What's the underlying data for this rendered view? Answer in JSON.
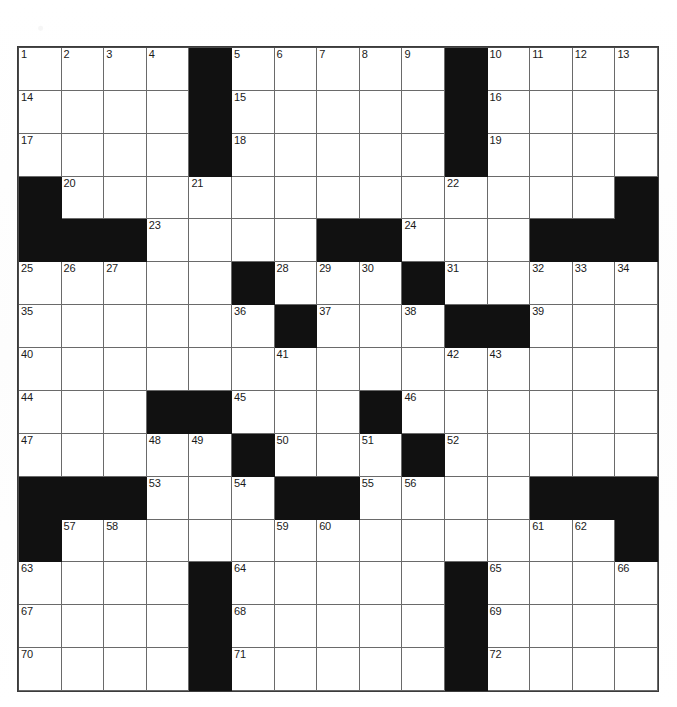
{
  "page": {
    "background_color": "#ffffff",
    "ink_color": "#111111",
    "grid_line_color": "#6a6a6a"
  },
  "grid": {
    "name": "crossword-grid",
    "rows": 15,
    "columns": 15,
    "block_color": "#111111",
    "cell_color": "#ffffff",
    "cells": [
      [
        {
          "type": "open",
          "number": "1"
        },
        {
          "type": "open",
          "number": "2"
        },
        {
          "type": "open",
          "number": "3"
        },
        {
          "type": "open",
          "number": "4"
        },
        {
          "type": "block",
          "number": ""
        },
        {
          "type": "open",
          "number": "5"
        },
        {
          "type": "open",
          "number": "6"
        },
        {
          "type": "open",
          "number": "7"
        },
        {
          "type": "open",
          "number": "8"
        },
        {
          "type": "open",
          "number": "9"
        },
        {
          "type": "block",
          "number": ""
        },
        {
          "type": "open",
          "number": "10"
        },
        {
          "type": "open",
          "number": "11"
        },
        {
          "type": "open",
          "number": "12"
        },
        {
          "type": "open",
          "number": "13"
        }
      ],
      [
        {
          "type": "open",
          "number": "14"
        },
        {
          "type": "open",
          "number": ""
        },
        {
          "type": "open",
          "number": ""
        },
        {
          "type": "open",
          "number": ""
        },
        {
          "type": "block",
          "number": ""
        },
        {
          "type": "open",
          "number": "15"
        },
        {
          "type": "open",
          "number": ""
        },
        {
          "type": "open",
          "number": ""
        },
        {
          "type": "open",
          "number": ""
        },
        {
          "type": "open",
          "number": ""
        },
        {
          "type": "block",
          "number": ""
        },
        {
          "type": "open",
          "number": "16"
        },
        {
          "type": "open",
          "number": ""
        },
        {
          "type": "open",
          "number": ""
        },
        {
          "type": "open",
          "number": ""
        }
      ],
      [
        {
          "type": "open",
          "number": "17"
        },
        {
          "type": "open",
          "number": ""
        },
        {
          "type": "open",
          "number": ""
        },
        {
          "type": "open",
          "number": ""
        },
        {
          "type": "block",
          "number": ""
        },
        {
          "type": "open",
          "number": "18"
        },
        {
          "type": "open",
          "number": ""
        },
        {
          "type": "open",
          "number": ""
        },
        {
          "type": "open",
          "number": ""
        },
        {
          "type": "open",
          "number": ""
        },
        {
          "type": "block",
          "number": ""
        },
        {
          "type": "open",
          "number": "19"
        },
        {
          "type": "open",
          "number": ""
        },
        {
          "type": "open",
          "number": ""
        },
        {
          "type": "open",
          "number": ""
        }
      ],
      [
        {
          "type": "block",
          "number": ""
        },
        {
          "type": "open",
          "number": "20"
        },
        {
          "type": "open",
          "number": ""
        },
        {
          "type": "open",
          "number": ""
        },
        {
          "type": "open",
          "number": "21"
        },
        {
          "type": "open",
          "number": ""
        },
        {
          "type": "open",
          "number": ""
        },
        {
          "type": "open",
          "number": ""
        },
        {
          "type": "open",
          "number": ""
        },
        {
          "type": "open",
          "number": ""
        },
        {
          "type": "open",
          "number": "22"
        },
        {
          "type": "open",
          "number": ""
        },
        {
          "type": "open",
          "number": ""
        },
        {
          "type": "open",
          "number": ""
        },
        {
          "type": "block",
          "number": ""
        }
      ],
      [
        {
          "type": "block",
          "number": ""
        },
        {
          "type": "block",
          "number": ""
        },
        {
          "type": "block",
          "number": ""
        },
        {
          "type": "open",
          "number": "23"
        },
        {
          "type": "open",
          "number": ""
        },
        {
          "type": "open",
          "number": ""
        },
        {
          "type": "open",
          "number": ""
        },
        {
          "type": "block",
          "number": ""
        },
        {
          "type": "block",
          "number": ""
        },
        {
          "type": "open",
          "number": "24"
        },
        {
          "type": "open",
          "number": ""
        },
        {
          "type": "open",
          "number": ""
        },
        {
          "type": "block",
          "number": ""
        },
        {
          "type": "block",
          "number": ""
        },
        {
          "type": "block",
          "number": ""
        }
      ],
      [
        {
          "type": "open",
          "number": "25"
        },
        {
          "type": "open",
          "number": "26"
        },
        {
          "type": "open",
          "number": "27"
        },
        {
          "type": "open",
          "number": ""
        },
        {
          "type": "open",
          "number": ""
        },
        {
          "type": "block",
          "number": ""
        },
        {
          "type": "open",
          "number": "28"
        },
        {
          "type": "open",
          "number": "29"
        },
        {
          "type": "open",
          "number": "30"
        },
        {
          "type": "block",
          "number": ""
        },
        {
          "type": "open",
          "number": "31"
        },
        {
          "type": "open",
          "number": ""
        },
        {
          "type": "open",
          "number": "32"
        },
        {
          "type": "open",
          "number": "33"
        },
        {
          "type": "open",
          "number": "34"
        }
      ],
      [
        {
          "type": "open",
          "number": "35"
        },
        {
          "type": "open",
          "number": ""
        },
        {
          "type": "open",
          "number": ""
        },
        {
          "type": "open",
          "number": ""
        },
        {
          "type": "open",
          "number": ""
        },
        {
          "type": "open",
          "number": "36"
        },
        {
          "type": "block",
          "number": ""
        },
        {
          "type": "open",
          "number": "37"
        },
        {
          "type": "open",
          "number": ""
        },
        {
          "type": "open",
          "number": "38"
        },
        {
          "type": "block",
          "number": ""
        },
        {
          "type": "block",
          "number": ""
        },
        {
          "type": "open",
          "number": "39"
        },
        {
          "type": "open",
          "number": ""
        },
        {
          "type": "open",
          "number": ""
        }
      ],
      [
        {
          "type": "open",
          "number": "40"
        },
        {
          "type": "open",
          "number": ""
        },
        {
          "type": "open",
          "number": ""
        },
        {
          "type": "open",
          "number": ""
        },
        {
          "type": "open",
          "number": ""
        },
        {
          "type": "open",
          "number": ""
        },
        {
          "type": "open",
          "number": "41"
        },
        {
          "type": "open",
          "number": ""
        },
        {
          "type": "open",
          "number": ""
        },
        {
          "type": "open",
          "number": ""
        },
        {
          "type": "open",
          "number": "42"
        },
        {
          "type": "open",
          "number": "43"
        },
        {
          "type": "open",
          "number": ""
        },
        {
          "type": "open",
          "number": ""
        },
        {
          "type": "open",
          "number": ""
        }
      ],
      [
        {
          "type": "open",
          "number": "44"
        },
        {
          "type": "open",
          "number": ""
        },
        {
          "type": "open",
          "number": ""
        },
        {
          "type": "block",
          "number": ""
        },
        {
          "type": "block",
          "number": ""
        },
        {
          "type": "open",
          "number": "45"
        },
        {
          "type": "open",
          "number": ""
        },
        {
          "type": "open",
          "number": ""
        },
        {
          "type": "block",
          "number": ""
        },
        {
          "type": "open",
          "number": "46"
        },
        {
          "type": "open",
          "number": ""
        },
        {
          "type": "open",
          "number": ""
        },
        {
          "type": "open",
          "number": ""
        },
        {
          "type": "open",
          "number": ""
        },
        {
          "type": "open",
          "number": ""
        }
      ],
      [
        {
          "type": "open",
          "number": "47"
        },
        {
          "type": "open",
          "number": ""
        },
        {
          "type": "open",
          "number": ""
        },
        {
          "type": "open",
          "number": "48"
        },
        {
          "type": "open",
          "number": "49"
        },
        {
          "type": "block",
          "number": ""
        },
        {
          "type": "open",
          "number": "50"
        },
        {
          "type": "open",
          "number": ""
        },
        {
          "type": "open",
          "number": "51"
        },
        {
          "type": "block",
          "number": ""
        },
        {
          "type": "open",
          "number": "52"
        },
        {
          "type": "open",
          "number": ""
        },
        {
          "type": "open",
          "number": ""
        },
        {
          "type": "open",
          "number": ""
        },
        {
          "type": "open",
          "number": ""
        }
      ],
      [
        {
          "type": "block",
          "number": ""
        },
        {
          "type": "block",
          "number": ""
        },
        {
          "type": "block",
          "number": ""
        },
        {
          "type": "open",
          "number": "53"
        },
        {
          "type": "open",
          "number": ""
        },
        {
          "type": "open",
          "number": "54"
        },
        {
          "type": "block",
          "number": ""
        },
        {
          "type": "block",
          "number": ""
        },
        {
          "type": "open",
          "number": "55"
        },
        {
          "type": "open",
          "number": "56"
        },
        {
          "type": "open",
          "number": ""
        },
        {
          "type": "open",
          "number": ""
        },
        {
          "type": "block",
          "number": ""
        },
        {
          "type": "block",
          "number": ""
        },
        {
          "type": "block",
          "number": ""
        }
      ],
      [
        {
          "type": "block",
          "number": ""
        },
        {
          "type": "open",
          "number": "57"
        },
        {
          "type": "open",
          "number": "58"
        },
        {
          "type": "open",
          "number": ""
        },
        {
          "type": "open",
          "number": ""
        },
        {
          "type": "open",
          "number": ""
        },
        {
          "type": "open",
          "number": "59"
        },
        {
          "type": "open",
          "number": "60"
        },
        {
          "type": "open",
          "number": ""
        },
        {
          "type": "open",
          "number": ""
        },
        {
          "type": "open",
          "number": ""
        },
        {
          "type": "open",
          "number": ""
        },
        {
          "type": "open",
          "number": "61"
        },
        {
          "type": "open",
          "number": "62"
        },
        {
          "type": "block",
          "number": ""
        }
      ],
      [
        {
          "type": "open",
          "number": "63"
        },
        {
          "type": "open",
          "number": ""
        },
        {
          "type": "open",
          "number": ""
        },
        {
          "type": "open",
          "number": ""
        },
        {
          "type": "block",
          "number": ""
        },
        {
          "type": "open",
          "number": "64"
        },
        {
          "type": "open",
          "number": ""
        },
        {
          "type": "open",
          "number": ""
        },
        {
          "type": "open",
          "number": ""
        },
        {
          "type": "open",
          "number": ""
        },
        {
          "type": "block",
          "number": ""
        },
        {
          "type": "open",
          "number": "65"
        },
        {
          "type": "open",
          "number": ""
        },
        {
          "type": "open",
          "number": ""
        },
        {
          "type": "open",
          "number": "66"
        }
      ],
      [
        {
          "type": "open",
          "number": "67"
        },
        {
          "type": "open",
          "number": ""
        },
        {
          "type": "open",
          "number": ""
        },
        {
          "type": "open",
          "number": ""
        },
        {
          "type": "block",
          "number": ""
        },
        {
          "type": "open",
          "number": "68"
        },
        {
          "type": "open",
          "number": ""
        },
        {
          "type": "open",
          "number": ""
        },
        {
          "type": "open",
          "number": ""
        },
        {
          "type": "open",
          "number": ""
        },
        {
          "type": "block",
          "number": ""
        },
        {
          "type": "open",
          "number": "69"
        },
        {
          "type": "open",
          "number": ""
        },
        {
          "type": "open",
          "number": ""
        },
        {
          "type": "open",
          "number": ""
        }
      ],
      [
        {
          "type": "open",
          "number": "70"
        },
        {
          "type": "open",
          "number": ""
        },
        {
          "type": "open",
          "number": ""
        },
        {
          "type": "open",
          "number": ""
        },
        {
          "type": "block",
          "number": ""
        },
        {
          "type": "open",
          "number": "71"
        },
        {
          "type": "open",
          "number": ""
        },
        {
          "type": "open",
          "number": ""
        },
        {
          "type": "open",
          "number": ""
        },
        {
          "type": "open",
          "number": ""
        },
        {
          "type": "block",
          "number": ""
        },
        {
          "type": "open",
          "number": "72"
        },
        {
          "type": "open",
          "number": ""
        },
        {
          "type": "open",
          "number": ""
        },
        {
          "type": "open",
          "number": ""
        }
      ]
    ]
  }
}
